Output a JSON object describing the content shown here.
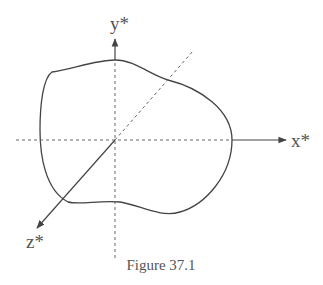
{
  "figure": {
    "caption": "Figure 37.1",
    "colors": {
      "line": "#444444",
      "dashed": "#666666",
      "text": "#555555",
      "background": "#ffffff"
    }
  },
  "axes": {
    "x": {
      "label": "x*"
    },
    "y": {
      "label": "y*"
    },
    "z": {
      "label": "z*"
    }
  },
  "shape": {
    "description": "irregular closed body outline"
  }
}
